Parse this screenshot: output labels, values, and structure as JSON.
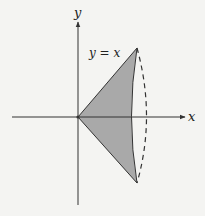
{
  "diagram": {
    "axes": {
      "x_label": "x",
      "y_label": "y"
    },
    "curve_label": "y = x",
    "colors": {
      "background": "#f4f4f2",
      "stroke": "#333333",
      "fill": "#a9a9a9"
    }
  }
}
